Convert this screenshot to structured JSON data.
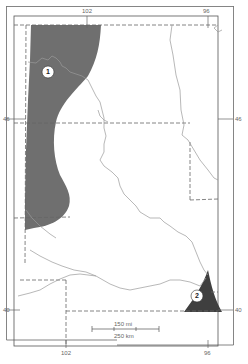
{
  "map": {
    "colors": {
      "background": "#ffffff",
      "frame": "#555555",
      "boundary": "#666666",
      "river": "#999999",
      "region_fill": "#6f6f6f",
      "marker_fill": "#ffffff"
    },
    "longitude_labels": {
      "top_left": "102",
      "top_right": "96",
      "bottom_left": "102",
      "bottom_right": "96"
    },
    "latitude_labels": {
      "left_upper": "46",
      "right_upper": "46",
      "left_lower": "40",
      "right_lower": "40"
    },
    "regions": [
      {
        "id": "1",
        "label": "1"
      },
      {
        "id": "2",
        "label": "2"
      }
    ],
    "scale_bar": {
      "miles_label": "150 mi",
      "km_label": "250 km"
    }
  }
}
